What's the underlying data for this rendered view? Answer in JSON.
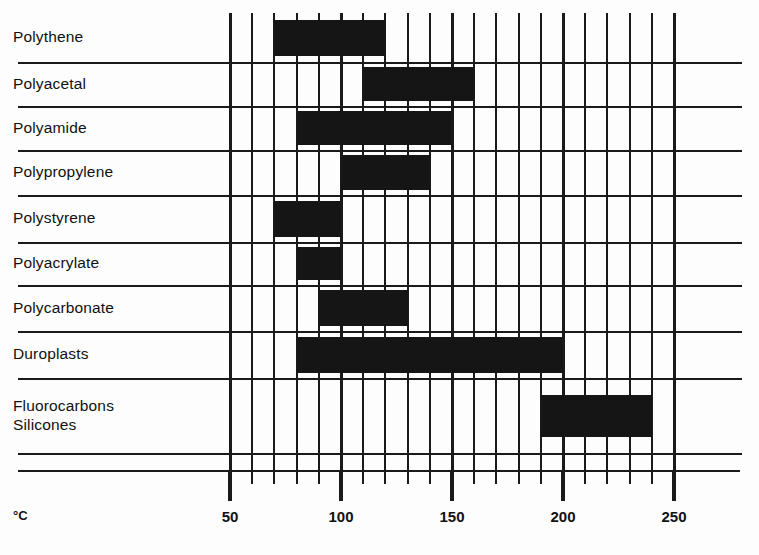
{
  "chart_data": {
    "type": "bar",
    "orientation": "horizontal-range",
    "title": "",
    "xlabel": "°C",
    "ylabel": "",
    "xlim": [
      50,
      250
    ],
    "xticks": [
      50,
      100,
      150,
      200,
      250
    ],
    "xtick_labels": [
      "50",
      "100",
      "150",
      "200",
      "250"
    ],
    "minor_tick_step": 10,
    "grid": true,
    "legend": null,
    "categories": [
      "Polythene",
      "Polyacetal",
      "Polyamide",
      "Polypropylene",
      "Polystyrene",
      "Polyacrylate",
      "Polycarbonate",
      "Duroplasts",
      "Fluorocarbons\nSilicones"
    ],
    "ranges": [
      {
        "name": "Polythene",
        "start": 70,
        "end": 120
      },
      {
        "name": "Polyacetal",
        "start": 110,
        "end": 160
      },
      {
        "name": "Polyamide",
        "start": 80,
        "end": 150
      },
      {
        "name": "Polypropylene",
        "start": 100,
        "end": 140
      },
      {
        "name": "Polystyrene",
        "start": 70,
        "end": 100
      },
      {
        "name": "Polyacrylate",
        "start": 80,
        "end": 100
      },
      {
        "name": "Polycarbonate",
        "start": 90,
        "end": 130
      },
      {
        "name": "Duroplasts",
        "start": 80,
        "end": 200
      },
      {
        "name": "Fluorocarbons Silicones",
        "start": 190,
        "end": 240
      }
    ],
    "bar_color": "#151515",
    "grid_color": "#1a1a1a"
  },
  "axis": {
    "unit": "°C",
    "ticks": [
      {
        "value": 50,
        "label": "50"
      },
      {
        "value": 100,
        "label": "100"
      },
      {
        "value": 150,
        "label": "150"
      },
      {
        "value": 200,
        "label": "200"
      },
      {
        "value": 250,
        "label": "250"
      }
    ]
  },
  "rows": [
    {
      "label": "Polythene"
    },
    {
      "label": "Polyacetal"
    },
    {
      "label": "Polyamide"
    },
    {
      "label": "Polypropylene"
    },
    {
      "label": "Polystyrene"
    },
    {
      "label": "Polyacrylate"
    },
    {
      "label": "Polycarbonate"
    },
    {
      "label": "Duroplasts"
    },
    {
      "label": "Fluorocarbons\nSilicones"
    }
  ]
}
